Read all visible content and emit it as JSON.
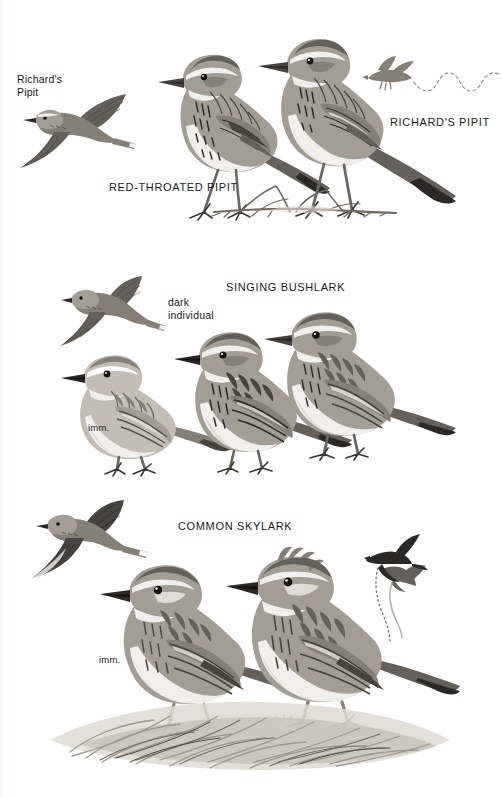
{
  "plate": {
    "title": "Pipits and Larks plate",
    "background_color": "#ffffff",
    "ink_dark": "#1a1a1a",
    "ink_mid": "#857f76",
    "ink_light": "#dedad4"
  },
  "panels": [
    {
      "id": "pipits",
      "labels": [
        {
          "name": "richards-pipit-flight-label",
          "text": "Richard's\nPipit",
          "style": "lower",
          "x": 17,
          "y": 73
        },
        {
          "name": "red-throated-pipit-label",
          "text": "RED-THROATED PIPIT",
          "style": "caps",
          "x": 109,
          "y": 180
        },
        {
          "name": "richards-pipit-label",
          "text": "RICHARD'S PIPIT",
          "style": "caps",
          "x": 390,
          "y": 115
        }
      ],
      "figures": [
        {
          "name": "richards-pipit-in-flight",
          "note": "flying bird, upper left"
        },
        {
          "name": "red-throated-pipit-standing",
          "note": "perched bird, centre"
        },
        {
          "name": "richards-pipit-standing",
          "note": "perched bird, right of centre"
        },
        {
          "name": "richards-pipit-display-flight-silhouette",
          "note": "small flying bird upper right with wavy dashed song trail"
        }
      ]
    },
    {
      "id": "bushlark",
      "labels": [
        {
          "name": "singing-bushlark-label",
          "text": "SINGING BUSHLARK",
          "style": "caps",
          "x": 226,
          "y": 280
        },
        {
          "name": "dark-individual-label",
          "text": "dark\nindividual",
          "style": "lower",
          "x": 168,
          "y": 296
        },
        {
          "name": "bushlark-immature-label",
          "text": "imm.",
          "style": "small",
          "x": 88,
          "y": 422
        }
      ],
      "figures": [
        {
          "name": "singing-bushlark-in-flight",
          "note": "flying bird, upper left"
        },
        {
          "name": "singing-bushlark-immature",
          "note": "perched immature, lower left"
        },
        {
          "name": "singing-bushlark-dark-individual",
          "note": "perched dark individual, centre"
        },
        {
          "name": "singing-bushlark-adult",
          "note": "perched adult, right"
        },
        {
          "name": "singing-bushlark-song-flight-silhouette",
          "note": "small black silhouette with descending song trail, upper right"
        }
      ]
    },
    {
      "id": "skylark",
      "labels": [
        {
          "name": "common-skylark-label",
          "text": "COMMON SKYLARK",
          "style": "caps",
          "x": 178,
          "y": 519
        },
        {
          "name": "skylark-immature-label",
          "text": "imm.",
          "style": "small",
          "x": 99,
          "y": 654
        }
      ],
      "figures": [
        {
          "name": "common-skylark-in-flight",
          "note": "flying bird, upper left"
        },
        {
          "name": "common-skylark-immature",
          "note": "perched immature, left, in grass"
        },
        {
          "name": "common-skylark-adult",
          "note": "perched crested adult, right, in grass"
        },
        {
          "name": "common-skylark-song-flight-silhouette",
          "note": "black silhouette with long dotted song trail, upper right"
        },
        {
          "name": "grass-tussock-foreground",
          "note": "grass clump at base of both skylarks"
        }
      ]
    }
  ]
}
